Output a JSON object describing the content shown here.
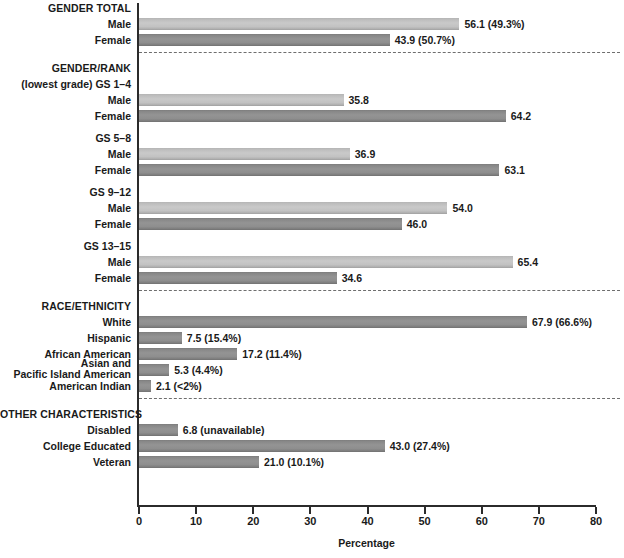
{
  "chart_data": {
    "type": "bar",
    "title": "",
    "xlabel": "Percentage",
    "ylabel": "",
    "xlim": [
      0,
      80
    ],
    "xticks": [
      0,
      10,
      20,
      30,
      40,
      50,
      60,
      70,
      80
    ],
    "grid": false,
    "orientation": "horizontal",
    "legend": "none",
    "colors": {
      "light_bar": "#c2c2c2",
      "dark_bar": "#8e8e8e",
      "axis": "#2b2b2b",
      "text": "#1a1a1a",
      "divider": "#6e6e6e"
    },
    "sections": [
      {
        "heading": "GENDER TOTAL",
        "subheading": null,
        "rows": [
          {
            "label": "Male",
            "value": 56.1,
            "label_text": "56.1 (49.3%)",
            "shade": "light"
          },
          {
            "label": "Female",
            "value": 43.9,
            "label_text": "43.9 (50.7%)",
            "shade": "dark"
          }
        ]
      },
      {
        "heading": "GENDER/RANK",
        "subheading": "(lowest grade) GS 1–4",
        "rows": [
          {
            "label": "Male",
            "value": 35.8,
            "label_text": "35.8",
            "shade": "light"
          },
          {
            "label": "Female",
            "value": 64.2,
            "label_text": "64.2",
            "shade": "dark"
          }
        ]
      },
      {
        "heading": null,
        "subheading": "GS 5–8",
        "rows": [
          {
            "label": "Male",
            "value": 36.9,
            "label_text": "36.9",
            "shade": "light"
          },
          {
            "label": "Female",
            "value": 63.1,
            "label_text": "63.1",
            "shade": "dark"
          }
        ]
      },
      {
        "heading": null,
        "subheading": "GS 9–12",
        "rows": [
          {
            "label": "Male",
            "value": 54.0,
            "label_text": "54.0",
            "shade": "light"
          },
          {
            "label": "Female",
            "value": 46.0,
            "label_text": "46.0",
            "shade": "dark"
          }
        ]
      },
      {
        "heading": null,
        "subheading": "GS 13–15",
        "rows": [
          {
            "label": "Male",
            "value": 65.4,
            "label_text": "65.4",
            "shade": "light"
          },
          {
            "label": "Female",
            "value": 34.6,
            "label_text": "34.6",
            "shade": "dark"
          }
        ]
      },
      {
        "heading": "RACE/ETHNICITY",
        "subheading": null,
        "rows": [
          {
            "label": "White",
            "value": 67.9,
            "label_text": "67.9 (66.6%)",
            "shade": "dark"
          },
          {
            "label": "Hispanic",
            "value": 7.5,
            "label_text": "7.5 (15.4%)",
            "shade": "dark"
          },
          {
            "label": "African American",
            "value": 17.2,
            "label_text": "17.2 (11.4%)",
            "shade": "dark"
          },
          {
            "label": "Asian and\nPacific Island American",
            "value": 5.3,
            "label_text": "5.3 (4.4%)",
            "shade": "dark"
          },
          {
            "label": "American Indian",
            "value": 2.1,
            "label_text": "2.1 (<2%)",
            "shade": "dark"
          }
        ]
      },
      {
        "heading": "OTHER CHARACTERISTICS",
        "subheading": null,
        "rows": [
          {
            "label": "Disabled",
            "value": 6.8,
            "label_text": "6.8 (unavailable)",
            "shade": "dark"
          },
          {
            "label": "College Educated",
            "value": 43.0,
            "label_text": "43.0 (27.4%)",
            "shade": "dark"
          },
          {
            "label": "Veteran",
            "value": 21.0,
            "label_text": "21.0 (10.1%)",
            "shade": "dark"
          }
        ]
      }
    ]
  }
}
